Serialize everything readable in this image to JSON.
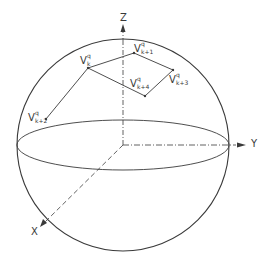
{
  "figure": {
    "colors": {
      "stroke": "#3a3a3a",
      "background": "#ffffff"
    },
    "axes": {
      "x_label": "X",
      "y_label": "Y",
      "z_label": "Z"
    },
    "vertices": [
      {
        "base": "V",
        "sup": "q",
        "sub": "k"
      },
      {
        "base": "V",
        "sup": "q",
        "sub": "k+1"
      },
      {
        "base": "V",
        "sup": "q",
        "sub": "k+2"
      },
      {
        "base": "V",
        "sup": "q",
        "sub": "k+3"
      },
      {
        "base": "V",
        "sup": "q",
        "sub": "k+4"
      }
    ]
  }
}
